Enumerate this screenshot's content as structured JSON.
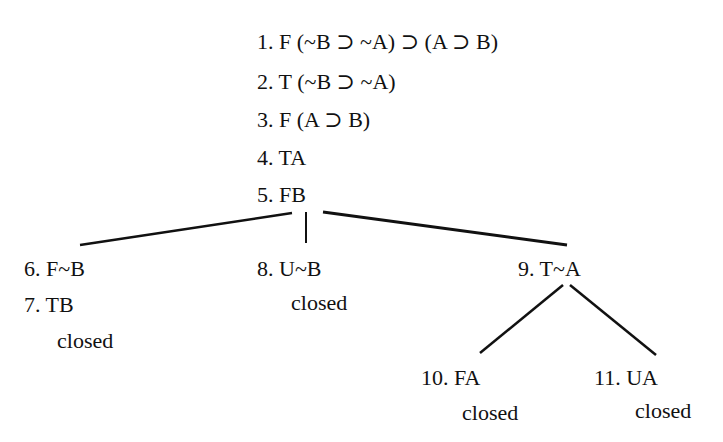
{
  "tableau": {
    "trunk": [
      {
        "num": "1.",
        "text": "F (~B ⊃ ~A) ⊃ (A ⊃ B)"
      },
      {
        "num": "2.",
        "text": "T (~B ⊃ ~A)"
      },
      {
        "num": "3.",
        "text": "F (A ⊃ B)"
      },
      {
        "num": "4.",
        "text": "TA"
      },
      {
        "num": "5.",
        "text": "FB"
      }
    ],
    "branch_left": {
      "lines": [
        {
          "num": "6.",
          "text": "F~B"
        },
        {
          "num": "7.",
          "text": "TB"
        }
      ],
      "status": "closed"
    },
    "branch_middle": {
      "lines": [
        {
          "num": "8.",
          "text": "U~B"
        }
      ],
      "status": "closed"
    },
    "branch_right": {
      "lines": [
        {
          "num": "9.",
          "text": "T~A"
        }
      ],
      "children": [
        {
          "num": "10.",
          "text": "FA",
          "status": "closed"
        },
        {
          "num": "11.",
          "text": "UA",
          "status": "closed"
        }
      ]
    }
  },
  "colors": {
    "ink": "#111111",
    "background": "#ffffff"
  }
}
